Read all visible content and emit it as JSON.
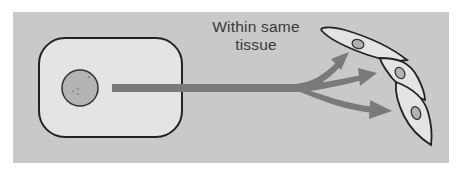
{
  "figure": {
    "label_line1": "Within same",
    "label_line2": "tissue",
    "colors": {
      "background": "#ffffff",
      "panel": "#c9c9c9",
      "cell_fill": "#e4e4e4",
      "cell_outline": "#222222",
      "nucleus_fill": "#b3b3b3",
      "arrow": "#7a7a7a",
      "text": "#3a3a3a"
    },
    "source_cell": {
      "shape": "rounded-rectangle",
      "has_nucleus": true
    },
    "target_cells": {
      "count": 3,
      "shape": "spindle",
      "has_nucleus": true
    },
    "arrow": {
      "type": "branching",
      "branches": 3
    }
  }
}
